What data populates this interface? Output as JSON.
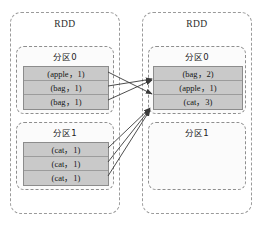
{
  "diagram": {
    "colors": {
      "cell_fill": "#c9c9c9",
      "cell_border": "#8c8c8c",
      "box_border": "#9a9a9a",
      "arrow": "#3a3a3a",
      "background": "#ffffff"
    }
  },
  "source_rdd": {
    "label": "RDD",
    "partitions": [
      {
        "label": "分区0",
        "records": [
          {
            "key": "apple",
            "value": 1,
            "text": "(apple，1)"
          },
          {
            "key": "bag",
            "value": 1,
            "text": "(bag，1)"
          },
          {
            "key": "bag",
            "value": 1,
            "text": "(bag，1)"
          }
        ]
      },
      {
        "label": "分区1",
        "records": [
          {
            "key": "cat",
            "value": 1,
            "text": "(cat，1)"
          },
          {
            "key": "cat",
            "value": 1,
            "text": "(cat，1)"
          },
          {
            "key": "cat",
            "value": 1,
            "text": "(cat，1)"
          }
        ]
      }
    ]
  },
  "target_rdd": {
    "label": "RDD",
    "partitions": [
      {
        "label": "分区0",
        "records": [
          {
            "key": "bag",
            "value": 2,
            "text": "(bag，2)"
          },
          {
            "key": "apple",
            "value": 1,
            "text": "(apple，1)"
          },
          {
            "key": "cat",
            "value": 3,
            "text": "(cat，3)"
          }
        ]
      },
      {
        "label": "分区1",
        "records": []
      }
    ]
  },
  "edges": [
    {
      "from": "source.p0.apple",
      "to": "target.p0.apple"
    },
    {
      "from": "source.p0.bag.1",
      "to": "target.p0.bag"
    },
    {
      "from": "source.p0.bag.2",
      "to": "target.p0.bag"
    },
    {
      "from": "source.p1.cat.1",
      "to": "target.p0.cat"
    },
    {
      "from": "source.p1.cat.2",
      "to": "target.p0.cat"
    },
    {
      "from": "source.p1.cat.3",
      "to": "target.p0.cat"
    }
  ]
}
